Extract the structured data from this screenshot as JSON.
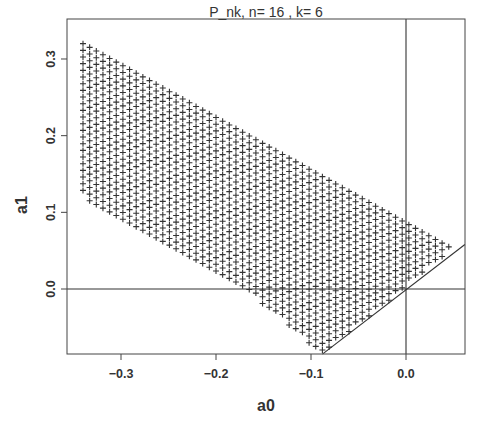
{
  "chart_data": {
    "type": "scatter",
    "title": "P_nk, n= 16 , k= 6",
    "xlabel": "a0",
    "ylabel": "a1",
    "xlim": [
      -0.357,
      0.062
    ],
    "ylim": [
      -0.085,
      0.353
    ],
    "x_ticks": [
      -0.3,
      -0.2,
      -0.1,
      0.0
    ],
    "x_tick_labels": [
      "-0.3",
      "-0.2",
      "-0.1",
      "0.0"
    ],
    "y_ticks": [
      0.0,
      0.1,
      0.2,
      0.3
    ],
    "y_tick_labels": [
      "0.0",
      "0.1",
      "0.2",
      "0.3"
    ],
    "grid": false,
    "legend": null,
    "marker": "+",
    "point_grid": {
      "a0_start": -0.34,
      "a0_step": 0.007,
      "a0_count": 57,
      "a1_step": 0.0087,
      "region": {
        "left_a0": -0.34,
        "upper_boundary": [
          [
            -0.34,
            0.32
          ],
          [
            0.045,
            0.055
          ]
        ],
        "lower_boundary": [
          [
            -0.34,
            0.12
          ],
          [
            -0.17,
            0.0
          ],
          [
            -0.088,
            -0.085
          ]
        ],
        "right_boundary_line": {
          "slope": 1.0,
          "intercept": 0.003
        }
      }
    },
    "reference_lines": [
      {
        "type": "hline",
        "y": 0.0,
        "label": "a1 = 0"
      },
      {
        "type": "vline",
        "x": 0.0,
        "label": "a0 = 0"
      },
      {
        "type": "abline",
        "slope": 1.0,
        "intercept": 0.0,
        "from": [
          -0.088,
          -0.085
        ],
        "to": [
          0.062,
          0.058
        ]
      }
    ]
  }
}
